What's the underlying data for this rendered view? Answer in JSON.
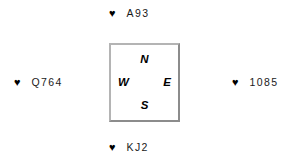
{
  "diagram": {
    "type": "bridge-suit-layout",
    "suit_symbol": "♥",
    "suit_name": "hearts",
    "suit_color": "#000000",
    "background_color": "#ffffff",
    "box_border_color": "#b4b4b4"
  },
  "compass": {
    "north_label": "N",
    "south_label": "S",
    "west_label": "W",
    "east_label": "E"
  },
  "hands": {
    "north": {
      "suit": "♥",
      "cards": "A93"
    },
    "south": {
      "suit": "♥",
      "cards": "KJ2"
    },
    "west": {
      "suit": "♥",
      "cards": "Q764"
    },
    "east": {
      "suit": "♥",
      "cards": "1085"
    }
  }
}
